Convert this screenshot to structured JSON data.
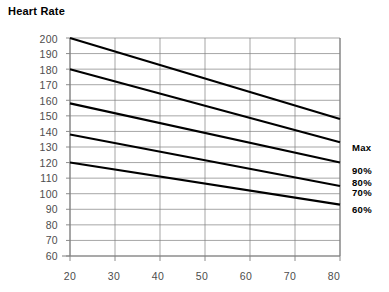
{
  "title": "Heart Rate",
  "chart_data": {
    "type": "line",
    "title": "Heart Rate",
    "xlabel": "",
    "ylabel": "",
    "x": [
      20,
      80
    ],
    "xlim": [
      20,
      80
    ],
    "ylim": [
      60,
      200
    ],
    "xticks": [
      "20",
      "30",
      "40",
      "50",
      "60",
      "70",
      "80"
    ],
    "yticks": [
      "60",
      "70",
      "80",
      "90",
      "100",
      "110",
      "120",
      "130",
      "140",
      "150",
      "160",
      "170",
      "180",
      "190",
      "200"
    ],
    "grid": true,
    "legend_position": "right",
    "series": [
      {
        "name": "Max",
        "values": [
          200,
          148
        ]
      },
      {
        "name": "90%",
        "values": [
          180,
          133
        ]
      },
      {
        "name": "80%",
        "values": [
          158,
          120
        ]
      },
      {
        "name": "70%",
        "values": [
          138,
          105
        ]
      },
      {
        "name": "60%",
        "values": [
          120,
          93
        ]
      }
    ]
  },
  "right_labels": [
    {
      "text": "Max"
    },
    {
      "text": "90%"
    },
    {
      "text": "80%"
    },
    {
      "text": "70%"
    },
    {
      "text": "60%"
    }
  ],
  "colors": {
    "line": "#000000",
    "grid": "#808080",
    "axis": "#808080",
    "tick_text": "#4d4d4d",
    "title_text": "#000000"
  }
}
